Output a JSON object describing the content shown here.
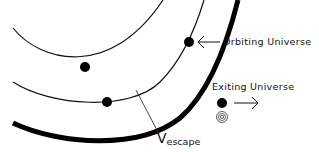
{
  "diagram": {
    "type": "orbit-escape-diagram",
    "colors": {
      "stroke": "#111111",
      "background": "#ffffff"
    },
    "labels": {
      "orbiting": "Orbiting Universe",
      "exiting": "Exiting Universe",
      "velocity_symbol": "V",
      "velocity_subscript": "escape"
    },
    "elements": {
      "inner_orbit": "thin arc",
      "middle_orbit": "thin arc",
      "boundary": "thick arc",
      "dots": 4,
      "arrows": [
        "left-pointing arrow to orbiting dot",
        "right-pointing arrow from exiting dot"
      ],
      "concentric_rings_icon": 1
    }
  }
}
